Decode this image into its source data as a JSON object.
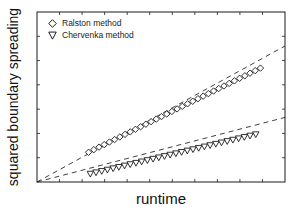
{
  "chart_data": {
    "type": "scatter",
    "title": "",
    "xlabel": "runtime",
    "ylabel": "squared boundary spreading",
    "xlim": [
      0,
      10
    ],
    "ylim": [
      0,
      10
    ],
    "x_tick_labels_shown": false,
    "y_tick_labels_shown": false,
    "grid": false,
    "legend_position": "upper left",
    "series": [
      {
        "name": "Ralston method",
        "marker": "diamond",
        "fit": "dashed linear, through origin",
        "fit_line": {
          "x": [
            0,
            10
          ],
          "y": [
            0,
            8.0
          ]
        },
        "x": [
          2.08,
          2.29,
          2.5,
          2.71,
          2.92,
          3.13,
          3.34,
          3.55,
          3.76,
          3.97,
          4.18,
          4.39,
          4.6,
          4.81,
          5.02,
          5.23,
          5.44,
          5.65,
          5.86,
          6.07,
          6.28,
          6.49,
          6.7,
          6.91,
          7.12,
          7.33,
          7.54,
          7.75,
          7.96,
          8.17,
          8.38,
          8.59,
          8.8,
          9.01
        ],
        "y": [
          1.75,
          1.9,
          2.05,
          2.2,
          2.35,
          2.5,
          2.65,
          2.8,
          2.95,
          3.1,
          3.25,
          3.4,
          3.55,
          3.7,
          3.85,
          4.0,
          4.15,
          4.3,
          4.45,
          4.6,
          4.75,
          4.9,
          5.05,
          5.2,
          5.35,
          5.5,
          5.65,
          5.8,
          5.95,
          6.1,
          6.25,
          6.4,
          6.55,
          6.7
        ]
      },
      {
        "name": "Chervenka method",
        "marker": "triangle-down",
        "fit": "dashed linear, through origin",
        "fit_line": {
          "x": [
            0,
            10
          ],
          "y": [
            0,
            3.8
          ]
        },
        "x": [
          2.15,
          2.38,
          2.61,
          2.84,
          3.07,
          3.3,
          3.53,
          3.76,
          3.99,
          4.22,
          4.45,
          4.68,
          4.91,
          5.14,
          5.37,
          5.6,
          5.83,
          6.06,
          6.29,
          6.52,
          6.75,
          6.98,
          7.21,
          7.44,
          7.67,
          7.9,
          8.13,
          8.36,
          8.59,
          8.82
        ],
        "y": [
          0.48,
          0.56,
          0.64,
          0.72,
          0.8,
          0.88,
          0.96,
          1.04,
          1.12,
          1.2,
          1.28,
          1.36,
          1.44,
          1.52,
          1.6,
          1.68,
          1.76,
          1.84,
          1.92,
          2.0,
          2.08,
          2.16,
          2.24,
          2.32,
          2.4,
          2.48,
          2.56,
          2.64,
          2.72,
          2.8
        ]
      }
    ]
  },
  "colors": {
    "axis": "#1a1a1a",
    "marker_stroke": "#1a1a1a",
    "fit_line": "#2a2a2a",
    "background": "#ffffff"
  },
  "labels": {
    "xlabel": "runtime",
    "ylabel": "squared boundary spreading",
    "legend": [
      "Ralston method",
      "Chervenka method"
    ]
  }
}
